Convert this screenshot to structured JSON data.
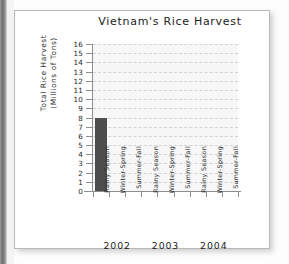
{
  "chart_data": {
    "type": "bar",
    "title": "Vietnam's Rice Harvest",
    "xlabel": "",
    "ylabel_line1": "Total Rice Harvest",
    "ylabel_line2": "(Millions of Tons)",
    "ylabel": "Total Rice Harvest (Millions of Tons)",
    "ylim": [
      0,
      16
    ],
    "ytick_labels": [
      "16",
      "15",
      "14",
      "13",
      "12",
      "11",
      "10",
      "9",
      "8",
      "7",
      "6",
      "5",
      "4",
      "3",
      "2",
      "1",
      "0"
    ],
    "ytick_values": [
      16,
      15,
      14,
      13,
      12,
      11,
      10,
      9,
      8,
      7,
      6,
      5,
      4,
      3,
      2,
      1,
      0
    ],
    "grid": true,
    "legend": "none",
    "group_label": "Year",
    "groups": [
      "2002",
      "2003",
      "2004"
    ],
    "categories": [
      "Rainy Season",
      "Winter-Spring",
      "Summer-Fall",
      "Rainy Season",
      "Winter-Spring",
      "Summer-Fall",
      "Rainy Season",
      "Winter-Spring",
      "Summer-Fall"
    ],
    "values": [
      8,
      null,
      null,
      null,
      null,
      null,
      null,
      null,
      null
    ],
    "bars": [
      {
        "group": "2002",
        "season": "Rainy Season",
        "value": 8
      },
      {
        "group": "2002",
        "season": "Winter-Spring",
        "value": null
      },
      {
        "group": "2002",
        "season": "Summer-Fall",
        "value": null
      },
      {
        "group": "2003",
        "season": "Rainy Season",
        "value": null
      },
      {
        "group": "2003",
        "season": "Winter-Spring",
        "value": null
      },
      {
        "group": "2003",
        "season": "Summer-Fall",
        "value": null
      },
      {
        "group": "2004",
        "season": "Rainy Season",
        "value": null
      },
      {
        "group": "2004",
        "season": "Winter-Spring",
        "value": null
      },
      {
        "group": "2004",
        "season": "Summer-Fall",
        "value": null
      }
    ],
    "colors": {
      "bar": "#4d4d4d",
      "plot_background": "#f7f7f7",
      "gridline": "#d2d2d2",
      "axis": "#8e8e8e",
      "text": "#222222",
      "card_background": "#ffffff",
      "card_border": "#b9b9b9"
    }
  }
}
